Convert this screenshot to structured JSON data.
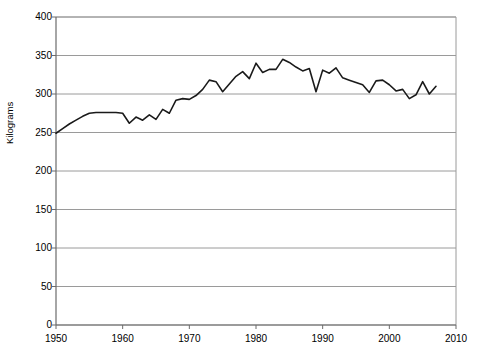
{
  "chart_data": {
    "type": "line",
    "title": "",
    "xlabel": "",
    "ylabel": "Kilograms",
    "xlim": [
      1950,
      2010
    ],
    "ylim": [
      0,
      400
    ],
    "ytick_labels": [
      "0",
      "50",
      "100",
      "150",
      "200",
      "250",
      "300",
      "350",
      "400"
    ],
    "yticks": [
      0,
      50,
      100,
      150,
      200,
      250,
      300,
      350,
      400
    ],
    "xtick_labels": [
      "1950",
      "1960",
      "1970",
      "1980",
      "1990",
      "2000",
      "2010"
    ],
    "xticks": [
      1950,
      1960,
      1970,
      1980,
      1990,
      2000,
      2010
    ],
    "grid": "horizontal",
    "legend": "none",
    "line_color": "#1a1a1a",
    "grid_color": "#9a9a9a",
    "axis_color": "#808080",
    "series": [
      {
        "name": "Kilograms",
        "x": [
          1950,
          1951,
          1952,
          1953,
          1954,
          1955,
          1956,
          1957,
          1958,
          1959,
          1960,
          1961,
          1962,
          1963,
          1964,
          1965,
          1966,
          1967,
          1968,
          1969,
          1970,
          1971,
          1972,
          1973,
          1974,
          1975,
          1976,
          1977,
          1978,
          1979,
          1980,
          1981,
          1982,
          1983,
          1984,
          1985,
          1986,
          1987,
          1988,
          1989,
          1990,
          1991,
          1992,
          1993,
          1994,
          1995,
          1996,
          1997,
          1998,
          1999,
          2000,
          2001,
          2002,
          2003,
          2004,
          2005,
          2006,
          2007
        ],
        "values": [
          249,
          255,
          261,
          266,
          271,
          275,
          276,
          276,
          276,
          276,
          275,
          262,
          270,
          266,
          273,
          267,
          280,
          275,
          292,
          294,
          293,
          298,
          306,
          318,
          316,
          303,
          313,
          323,
          329,
          320,
          340,
          328,
          332,
          332,
          345,
          341,
          335,
          330,
          333,
          303,
          331,
          327,
          334,
          321,
          318,
          315,
          312,
          302,
          317,
          318,
          312,
          304,
          306,
          294,
          299,
          316,
          300,
          310
        ]
      }
    ]
  }
}
